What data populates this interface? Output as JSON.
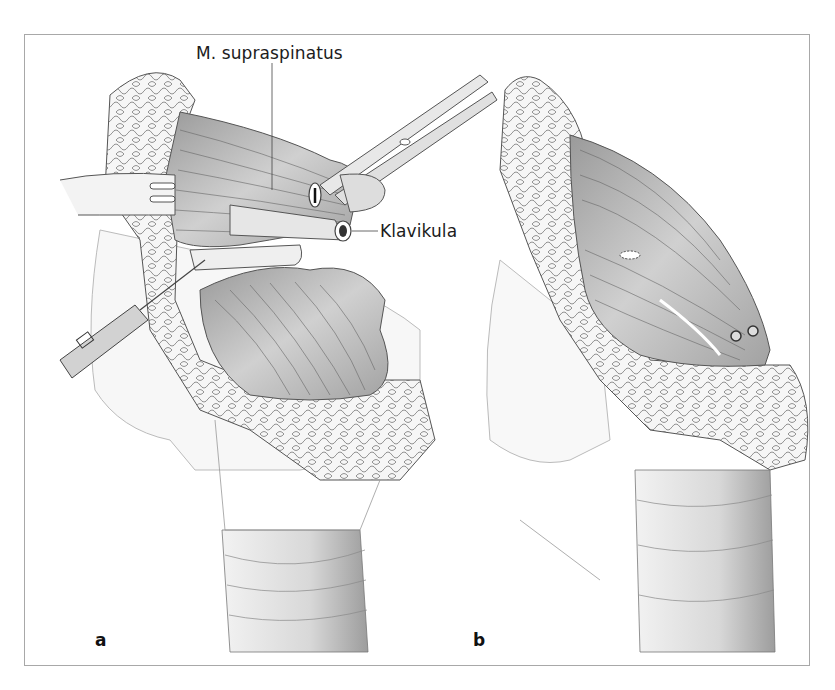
{
  "figure": {
    "panels": [
      {
        "letter": "a",
        "description": "Shoulder with M. supraspinatus retracted by clamp, Klavikula exposed, needle/instrument inserted"
      },
      {
        "letter": "b",
        "description": "Supraspinatus muscle reattached with two screw anchors"
      }
    ],
    "labels": {
      "supraspinatus": "M. supraspinatus",
      "klavikula": "Klavikula"
    },
    "colors": {
      "frame_border": "#a8a8a8",
      "muscle_fill": "#c9c9c9",
      "muscle_dark": "#8f8f8f",
      "fat_fill": "#f4f4f4",
      "outline": "#555555",
      "skin_fill": "#ececec"
    }
  }
}
